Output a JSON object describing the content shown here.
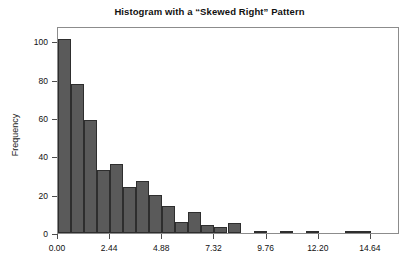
{
  "chart_data": {
    "type": "bar",
    "title": "Histogram with a “Skewed Right” Pattern",
    "xlabel": "",
    "ylabel": "Frequency",
    "ylim": [
      0,
      108
    ],
    "xlim": [
      0,
      16.0
    ],
    "grid": false,
    "legend": null,
    "bin_width": 0.61,
    "bar_color": "#5a5a5a",
    "bar_edge_color": "#2e2e2e",
    "frame_color": "#8c8c8c",
    "y_ticks": [
      0,
      20,
      40,
      60,
      80,
      100
    ],
    "y_tick_labels": [
      "0",
      "20",
      "40",
      "60",
      "80",
      "100"
    ],
    "x_ticks": [
      0.0,
      2.44,
      4.88,
      7.32,
      9.76,
      12.2,
      14.64
    ],
    "x_tick_labels": [
      "0.00",
      "2.44",
      "4.88",
      "7.32",
      "9.76",
      "12.20",
      "14.64"
    ],
    "bins": [
      {
        "left": 0.0,
        "right": 0.61,
        "value": 101
      },
      {
        "left": 0.61,
        "right": 1.22,
        "value": 78
      },
      {
        "left": 1.22,
        "right": 1.83,
        "value": 59
      },
      {
        "left": 1.83,
        "right": 2.44,
        "value": 33
      },
      {
        "left": 2.44,
        "right": 3.05,
        "value": 36
      },
      {
        "left": 3.05,
        "right": 3.66,
        "value": 24
      },
      {
        "left": 3.66,
        "right": 4.27,
        "value": 27
      },
      {
        "left": 4.27,
        "right": 4.88,
        "value": 20
      },
      {
        "left": 4.88,
        "right": 5.49,
        "value": 14
      },
      {
        "left": 5.49,
        "right": 6.1,
        "value": 6
      },
      {
        "left": 6.1,
        "right": 6.71,
        "value": 11
      },
      {
        "left": 6.71,
        "right": 7.32,
        "value": 4
      },
      {
        "left": 7.32,
        "right": 7.93,
        "value": 3
      },
      {
        "left": 7.93,
        "right": 8.54,
        "value": 5
      },
      {
        "left": 8.54,
        "right": 9.15,
        "value": 0
      },
      {
        "left": 9.15,
        "right": 9.76,
        "value": 1
      },
      {
        "left": 9.76,
        "right": 10.37,
        "value": 0
      },
      {
        "left": 10.37,
        "right": 10.98,
        "value": 1
      },
      {
        "left": 10.98,
        "right": 11.59,
        "value": 0
      },
      {
        "left": 11.59,
        "right": 12.2,
        "value": 1
      },
      {
        "left": 12.2,
        "right": 12.81,
        "value": 0
      },
      {
        "left": 12.81,
        "right": 13.42,
        "value": 0
      },
      {
        "left": 13.42,
        "right": 14.03,
        "value": 1
      },
      {
        "left": 14.03,
        "right": 14.64,
        "value": 1
      },
      {
        "left": 14.64,
        "right": 15.25,
        "value": 0
      }
    ]
  }
}
